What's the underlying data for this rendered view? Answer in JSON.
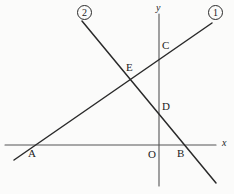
{
  "figure": {
    "background_color": "#fbfbfa",
    "stroke_color": "#2a2a2a",
    "axis_color": "#555555",
    "width": 234,
    "height": 194
  },
  "axes": {
    "x_axis": {
      "label": "x",
      "label_x": 222,
      "label_y": 138,
      "y_pixel": 145,
      "x_start": 5,
      "x_end": 216
    },
    "y_axis": {
      "label": "y",
      "label_x": 156,
      "label_y": 3,
      "x_pixel": 159,
      "y_start": 14,
      "y_end": 186
    },
    "origin": {
      "label": "O",
      "label_x": 148,
      "label_y": 149,
      "x": 159,
      "y": 145
    }
  },
  "lines": [
    {
      "id": "line-1",
      "label": "①",
      "label_text": "1",
      "label_x": 208,
      "label_y": 5,
      "x1": 14,
      "y1": 160,
      "x2": 212,
      "y2": 23,
      "description": "rising line through A and C"
    },
    {
      "id": "line-2",
      "label": "②",
      "label_text": "2",
      "label_x": 77,
      "label_y": 5,
      "x1": 82,
      "y1": 21,
      "x2": 216,
      "y2": 183,
      "description": "falling line through D and B"
    }
  ],
  "points": [
    {
      "name": "A",
      "label": "A",
      "x": 30,
      "y": 145,
      "label_x": 28,
      "label_y": 148
    },
    {
      "name": "B",
      "label": "B",
      "x": 180,
      "y": 145,
      "label_x": 177,
      "label_y": 148
    },
    {
      "name": "C",
      "label": "C",
      "x": 159,
      "y": 57,
      "label_x": 162,
      "label_y": 40
    },
    {
      "name": "D",
      "label": "D",
      "x": 159,
      "y": 108,
      "label_x": 162,
      "label_y": 101
    },
    {
      "name": "E",
      "label": "E",
      "x": 130,
      "y": 79,
      "label_x": 126,
      "label_y": 62
    }
  ]
}
